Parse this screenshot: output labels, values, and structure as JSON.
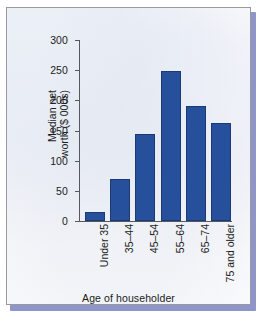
{
  "chart_data": {
    "type": "bar",
    "title": "",
    "subtitle": "",
    "xlabel": "Age of householder",
    "ylabel": "Median net worth ($ 000s)",
    "ylabel_lines": [
      "Median net",
      "worth ($ 000s)"
    ],
    "categories": [
      "Under 35",
      "35–44",
      "45–54",
      "55–64",
      "65–74",
      "75 and older"
    ],
    "values": [
      15,
      70,
      145,
      249,
      190,
      163
    ],
    "ylim": [
      0,
      300
    ],
    "yticks": [
      0,
      50,
      100,
      150,
      200,
      250,
      300
    ],
    "ytick_labels": [
      "0",
      "50",
      "100",
      "150",
      "200",
      "250",
      "300"
    ],
    "grid": false,
    "legend": null,
    "legend_position": "none",
    "series": [
      {
        "name": "Median net worth",
        "values": [
          15,
          70,
          145,
          249,
          190,
          163
        ]
      }
    ],
    "colors": {
      "bar_fill": "#27509c",
      "bar_stroke": "#1b3a74",
      "axis": "#55585c",
      "text": "#1c1c1c",
      "plot_background": "#f7f8fa",
      "frame_border": "#9a9a9a",
      "shadow_band": "#8e95c8"
    }
  }
}
